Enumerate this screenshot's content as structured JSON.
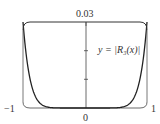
{
  "chart_data": {
    "type": "line",
    "title": "",
    "xlabel": "",
    "ylabel": "",
    "xlim": [
      -1,
      1
    ],
    "ylim": [
      0,
      0.03
    ],
    "x_tick_labels": [
      "−1",
      "0",
      "1"
    ],
    "y_tick_labels": [
      "0.03"
    ],
    "y_ticks": [
      0.01,
      0.02,
      0.03
    ],
    "annotation": "y = |R₃(x)|",
    "series": [
      {
        "name": "y = |R3(x)|",
        "x": [
          -1,
          -0.9,
          -0.8,
          -0.7,
          -0.6,
          -0.5,
          -0.4,
          -0.2,
          0,
          0.2,
          0.4,
          0.5,
          0.6,
          0.7,
          0.8,
          0.9,
          1
        ],
        "values": [
          0.03,
          0.0129,
          0.005,
          0.0017,
          0.0005,
          0.0001,
          2e-05,
          0,
          0,
          0,
          2e-05,
          0.0001,
          0.0005,
          0.0017,
          0.005,
          0.0129,
          0.03
        ]
      }
    ],
    "grid": false,
    "legend": "none"
  },
  "labels": {
    "top": "0.03",
    "left": "−1",
    "center": "0",
    "right": "1",
    "curve": "y = |R₃(x)|"
  }
}
